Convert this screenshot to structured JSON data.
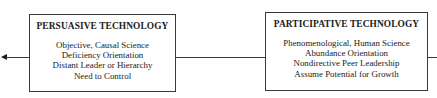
{
  "diagram": {
    "type": "flow",
    "left_box": {
      "title": "PERSUASIVE TECHNOLOGY",
      "lines": [
        "Objective, Causal Science",
        "Deficiency Orientation",
        "Distant Leader or Hierarchy",
        "Need to Control"
      ]
    },
    "right_box": {
      "title": "PARTICIPATIVE TECHNOLOGY",
      "lines": [
        "Phenomenological, Human Science",
        "Abundance Orientation",
        "Nondirective Peer Leadership",
        "Assume Potential for Growth"
      ]
    },
    "connectors": [
      {
        "from": "left_box",
        "to": "off-canvas-left",
        "arrow": "left"
      },
      {
        "from": "right_box",
        "to": "left_box",
        "arrow": "none"
      },
      {
        "from": "off-canvas-right",
        "to": "right_box",
        "arrow": "none"
      }
    ],
    "colors": {
      "line": "#3a3a3a",
      "text": "#1a1a1a",
      "background": "#ffffff"
    }
  }
}
